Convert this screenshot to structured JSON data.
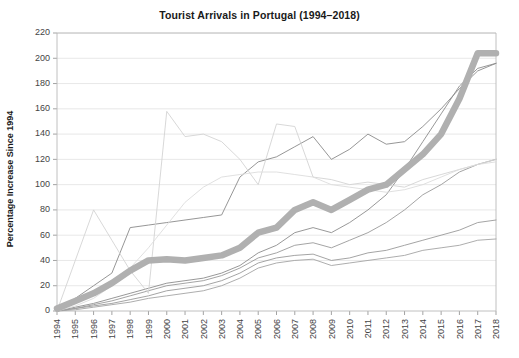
{
  "chart_data": {
    "type": "line",
    "title": "Tourist Arrivals in Portugal (1994–2018)",
    "xlabel": "",
    "ylabel": "Percentage Increase Since 1994",
    "xlim": [
      1994,
      2018
    ],
    "ylim": [
      0,
      220
    ],
    "yticks": [
      0,
      20,
      40,
      60,
      80,
      100,
      120,
      140,
      160,
      180,
      200,
      220
    ],
    "grid": true,
    "legend": "none",
    "x": [
      1994,
      1995,
      1996,
      1997,
      1998,
      1999,
      2000,
      2001,
      2002,
      2003,
      2004,
      2005,
      2006,
      2007,
      2008,
      2009,
      2010,
      2011,
      2012,
      2013,
      2014,
      2015,
      2016,
      2017,
      2018
    ],
    "categories": [
      "1994",
      "1995",
      "1996",
      "1997",
      "1998",
      "1999",
      "2000",
      "2001",
      "2002",
      "2003",
      "2004",
      "2005",
      "2006",
      "2007",
      "2008",
      "2009",
      "2010",
      "2011",
      "2012",
      "2013",
      "2014",
      "2015",
      "2016",
      "2017",
      "2018"
    ],
    "series": [
      {
        "name": "portugal-highlight",
        "highlight": true,
        "color": "#b0b0b0",
        "width": 6.5,
        "values": [
          2,
          8,
          14,
          22,
          32,
          40,
          41,
          40,
          42,
          44,
          50,
          62,
          66,
          80,
          86,
          80,
          88,
          96,
          100,
          112,
          124,
          140,
          168,
          204,
          204
        ]
      },
      {
        "name": "series-b",
        "highlight": false,
        "color": "#8c8c8c",
        "width": 0.9,
        "values": [
          0,
          3,
          6,
          10,
          14,
          18,
          22,
          24,
          26,
          30,
          36,
          46,
          52,
          62,
          66,
          62,
          70,
          80,
          92,
          112,
          134,
          156,
          178,
          192,
          196
        ]
      },
      {
        "name": "series-c",
        "highlight": false,
        "color": "#9a9a9a",
        "width": 0.9,
        "values": [
          0,
          2,
          5,
          8,
          12,
          16,
          20,
          22,
          24,
          28,
          34,
          42,
          46,
          52,
          54,
          50,
          56,
          62,
          70,
          80,
          92,
          100,
          110,
          116,
          120
        ]
      },
      {
        "name": "series-d",
        "highlight": false,
        "color": "#9a9a9a",
        "width": 0.9,
        "values": [
          0,
          2,
          4,
          6,
          9,
          12,
          16,
          18,
          20,
          24,
          30,
          38,
          42,
          44,
          45,
          40,
          42,
          46,
          48,
          52,
          56,
          60,
          64,
          70,
          72
        ]
      },
      {
        "name": "series-e",
        "highlight": false,
        "color": "#a4a4a4",
        "width": 0.9,
        "values": [
          0,
          1,
          3,
          5,
          7,
          10,
          12,
          14,
          16,
          20,
          26,
          34,
          38,
          40,
          41,
          36,
          38,
          40,
          42,
          44,
          48,
          50,
          52,
          56,
          57
        ]
      },
      {
        "name": "series-f",
        "highlight": false,
        "color": "#8a8a8a",
        "width": 0.9,
        "values": [
          0,
          10,
          20,
          30,
          66,
          68,
          70,
          72,
          74,
          76,
          106,
          118,
          122,
          130,
          138,
          120,
          128,
          140,
          132,
          134,
          146,
          160,
          176,
          190,
          196
        ]
      },
      {
        "name": "series-g",
        "highlight": false,
        "color": "#d4d4d4",
        "width": 0.9,
        "values": [
          0,
          40,
          80,
          56,
          32,
          14,
          158,
          138,
          140,
          134,
          120,
          100,
          148,
          146,
          106,
          104,
          100,
          102,
          100,
          98,
          104,
          108,
          112,
          116,
          120
        ]
      },
      {
        "name": "series-h",
        "highlight": false,
        "color": "#dcdcdc",
        "width": 0.9,
        "values": [
          0,
          4,
          10,
          20,
          34,
          50,
          68,
          86,
          98,
          106,
          108,
          110,
          110,
          108,
          106,
          100,
          98,
          96,
          94,
          96,
          100,
          106,
          112,
          116,
          118
        ]
      }
    ]
  }
}
